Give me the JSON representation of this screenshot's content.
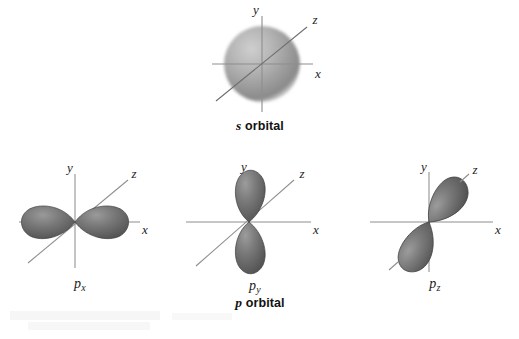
{
  "figure": {
    "title_visible": false,
    "background_color": "#ffffff",
    "axis_color": "#8e8e8e",
    "lobe_color_dark": "#5f5f5f",
    "lobe_color_mid": "#6f6f6f",
    "lobe_color_light": "#a8a8a8",
    "sphere_color_edge": "#8c8c8c",
    "sphere_color_center": "#bdbdbd",
    "label_color": "#1c1c1c"
  },
  "diagrams": [
    {
      "id": "s-orbital",
      "kind": "sphere",
      "caption": "s orbital",
      "caption_symbol": "s",
      "caption_rest": " orbital",
      "axes": [
        {
          "name": "y",
          "label": "y",
          "orientation": "vertical"
        },
        {
          "name": "x",
          "label": "x",
          "orientation": "horizontal"
        },
        {
          "name": "z",
          "label": "z",
          "orientation": "diagonal"
        }
      ]
    },
    {
      "id": "p-x-orbital",
      "kind": "lobes",
      "label_symbol": "p",
      "label_subscript": "x",
      "lobe_orientation_deg": 0,
      "axes": [
        {
          "name": "y",
          "label": "y",
          "orientation": "vertical"
        },
        {
          "name": "x",
          "label": "x",
          "orientation": "horizontal"
        },
        {
          "name": "z",
          "label": "z",
          "orientation": "diagonal"
        }
      ]
    },
    {
      "id": "p-y-orbital",
      "kind": "lobes",
      "label_symbol": "p",
      "label_subscript": "y",
      "lobe_orientation_deg": 90,
      "axes": [
        {
          "name": "y",
          "label": "y",
          "orientation": "vertical"
        },
        {
          "name": "x",
          "label": "x",
          "orientation": "horizontal"
        },
        {
          "name": "z",
          "label": "z",
          "orientation": "diagonal"
        }
      ]
    },
    {
      "id": "p-z-orbital",
      "kind": "lobes",
      "label_symbol": "p",
      "label_subscript": "z",
      "lobe_orientation_deg": 58,
      "axes": [
        {
          "name": "y",
          "label": "y",
          "orientation": "vertical"
        },
        {
          "name": "x",
          "label": "x",
          "orientation": "horizontal"
        },
        {
          "name": "z",
          "label": "z",
          "orientation": "diagonal"
        }
      ]
    }
  ],
  "group_caption": {
    "symbol": "p",
    "rest": " orbital",
    "full": "p orbital"
  },
  "labels": {
    "s_caption_symbol": "s",
    "s_caption_rest": " orbital",
    "px_symbol": "p",
    "px_sub": "x",
    "py_symbol": "p",
    "py_sub": "y",
    "pz_symbol": "p",
    "pz_sub": "z",
    "axis_x": "x",
    "axis_y": "y",
    "axis_z": "z"
  }
}
